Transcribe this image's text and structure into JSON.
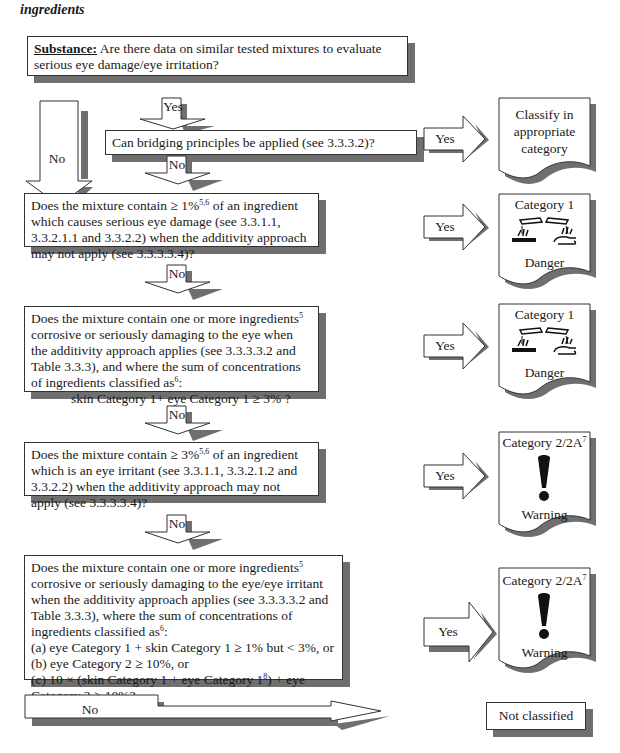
{
  "heading": "ingredients",
  "substance_box": {
    "label": "Substance:",
    "text": " Are there data on similar tested mixtures to evaluate serious eye damage/eye irritation?"
  },
  "arrows": {
    "yes": "Yes",
    "no": "No"
  },
  "questions": [
    {
      "id": "bridging",
      "text": "Can bridging principles be applied (see 3.3.3.2)?",
      "yes_outcome": 0
    },
    {
      "id": "q1",
      "text_a": "Does the mixture contain ≥ 1%",
      "sup_a": "5,6",
      "text_b": "  of an ingredient which causes serious eye damage (see 3.3.1.1, 3.3.2.1.1 and 3.3.2.2) when the additivity approach may not apply (see 3.3.3.3.4)?",
      "yes_outcome": 1
    },
    {
      "id": "q2",
      "text_a": "Does the mixture contain one or more ingredients",
      "sup_a": "5",
      "text_b": " corrosive or seriously damaging to the eye when the additivity approach applies (see 3.3.3.3.2 and Table 3.3.3), and where the sum of concentrations of ingredients classified as",
      "sup_b": "6",
      "text_c": ":",
      "criterion": "skin Category 1+ eye Category 1 ≥ 3% ?",
      "yes_outcome": 2
    },
    {
      "id": "q3",
      "text_a": "Does the mixture contain ≥ 3%",
      "sup_a": "5,6",
      "text_b": "  of an ingredient which is an eye irritant (see 3.3.1.1, 3.3.2.1.2 and 3.3.2.2) when the additivity approach may not apply (see 3.3.3.3.4)?",
      "yes_outcome": 3
    },
    {
      "id": "q4",
      "text_a": "Does the mixture contain one or more ingredients",
      "sup_a": "5",
      "text_b": " corrosive or seriously damaging to the eye/eye irritant when the additivity approach applies (see 3.3.3.3.2 and Table 3.3.3), where the sum of concentrations of ingredients classified as",
      "sup_b": "6",
      "text_c": ":",
      "items": [
        "(a)  eye Category 1 + skin Category 1 ≥ 1% but < 3%, or",
        "(b)  eye Category 2 ≥ 10%, or"
      ],
      "item_c_a": "(c)  10 × (skin Category 1 + eye Category 1",
      "item_c_sup": "8",
      "item_c_b": ") + eye Category 2 ≥ 10%?",
      "yes_outcome": 4
    }
  ],
  "outcomes": [
    {
      "lines": [
        "Classify in",
        "appropriate",
        "category"
      ]
    },
    {
      "title": "Category 1",
      "pictogram": "corrosion-icon",
      "signal": "Danger"
    },
    {
      "title": "Category 1",
      "pictogram": "corrosion-icon",
      "signal": "Danger"
    },
    {
      "title": "Category 2/2A",
      "title_sup": "7",
      "pictogram": "exclamation-icon",
      "signal": "Warning"
    },
    {
      "title": "Category 2/2A",
      "title_sup": "7",
      "pictogram": "exclamation-icon",
      "signal": "Warning"
    }
  ],
  "final": {
    "no_label": "No",
    "result": "Not classified"
  },
  "colors": {
    "shadow": "#6f6f6f",
    "border": "#333333",
    "text": "#1a1a1a"
  }
}
